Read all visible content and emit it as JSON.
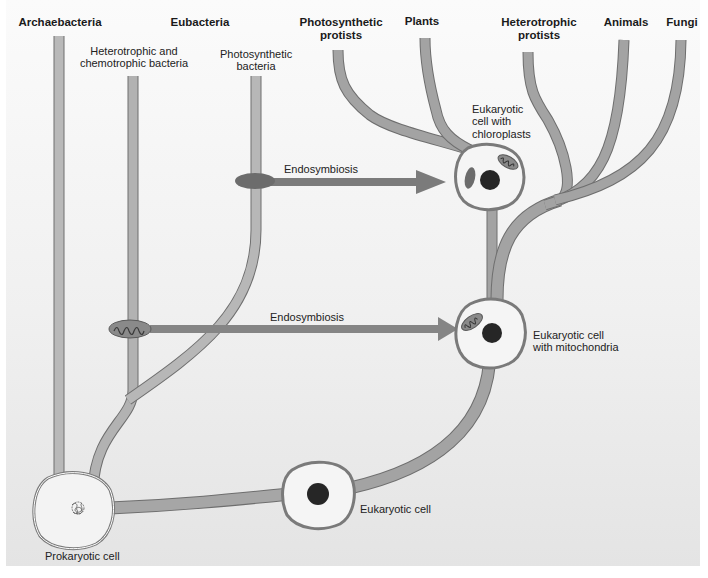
{
  "lineages": {
    "archaebacteria": "Archaebacteria",
    "eubacteria": "Eubacteria",
    "photosynthetic_protists": "Photosynthetic protists",
    "plants": "Plants",
    "heterotrophic_protists": "Heterotrophic protists",
    "animals": "Animals",
    "fungi": "Fungi"
  },
  "sublineages": {
    "heterotrophic_bacteria": "Heterotrophic and chemotrophic bacteria",
    "photosynthetic_bacteria": "Photosynthetic bacteria"
  },
  "cells": {
    "prokaryotic": "Prokaryotic cell",
    "eukaryotic": "Eukaryotic cell",
    "with_mitochondria": "Eukaryotic cell with mitochondria",
    "with_chloroplasts": "Eukaryotic cell with chloroplasts"
  },
  "events": {
    "endosymbiosis_chloroplast": "Endosymbiosis",
    "endosymbiosis_mitochondria": "Endosymbiosis"
  },
  "colors": {
    "branch_fill": "#a8a8a8",
    "branch_dark": "#8c8c8c",
    "arrow": "#7a7a7a",
    "nucleus": "#222222",
    "cell_fill": "#f4f4f4",
    "panel_top": "#fafafa",
    "panel_bottom": "#e6e6e6"
  }
}
